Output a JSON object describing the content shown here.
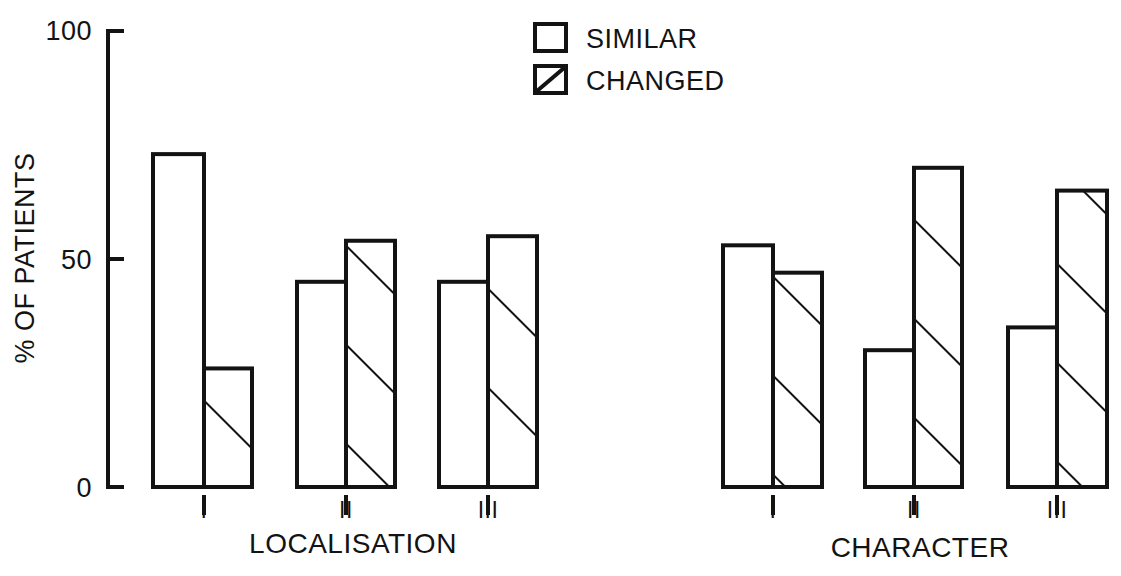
{
  "chart_data": {
    "type": "bar",
    "title": "",
    "subtitle": "",
    "xlabel": "",
    "ylabel": "% OF PATIENTS",
    "ylim": [
      0,
      100
    ],
    "yticks": [
      0,
      50,
      100
    ],
    "ytick_labels": [
      "0",
      "50",
      "100"
    ],
    "grid": false,
    "legend_position": "top-center",
    "series": [
      {
        "name": "SIMILAR",
        "style": "open",
        "values": [
          73,
          45,
          45,
          53,
          30,
          35
        ]
      },
      {
        "name": "CHANGED",
        "style": "hatched",
        "values": [
          26,
          54,
          55,
          47,
          70,
          65
        ]
      }
    ],
    "panels": [
      {
        "title": "LOCALISATION",
        "categories": [
          "I",
          "II",
          "III"
        ],
        "similar": [
          73,
          45,
          45
        ],
        "changed": [
          26,
          54,
          55
        ]
      },
      {
        "title": "CHARACTER",
        "categories": [
          "I",
          "II",
          "III"
        ],
        "similar": [
          53,
          30,
          35
        ],
        "changed": [
          47,
          70,
          65
        ]
      }
    ],
    "colors": {
      "ink": "#131313",
      "background": "#ffffff"
    }
  },
  "axis": {
    "y_label": "% OF PATIENTS",
    "ticks": [
      {
        "value": "100"
      },
      {
        "value": "50"
      },
      {
        "value": "0"
      }
    ]
  },
  "legend": {
    "items": [
      {
        "label": "SIMILAR",
        "pattern": "open-square"
      },
      {
        "label": "CHANGED",
        "pattern": "hatched-square"
      }
    ]
  },
  "panels": [
    {
      "name": "localisation",
      "title": "LOCALISATION",
      "groups": [
        {
          "label": "I",
          "similar": "73",
          "changed": "26"
        },
        {
          "label": "II",
          "similar": "45",
          "changed": "54"
        },
        {
          "label": "III",
          "similar": "45",
          "changed": "55"
        }
      ]
    },
    {
      "name": "character",
      "title": "CHARACTER",
      "groups": [
        {
          "label": "I",
          "similar": "53",
          "changed": "47"
        },
        {
          "label": "II",
          "similar": "30",
          "changed": "70"
        },
        {
          "label": "III",
          "similar": "35",
          "changed": "65"
        }
      ]
    }
  ]
}
